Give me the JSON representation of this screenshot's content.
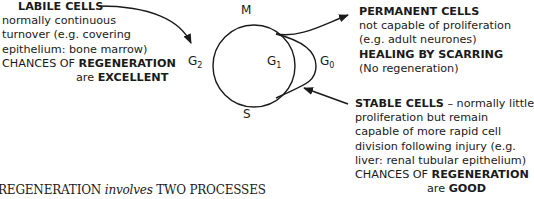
{
  "cycle": {
    "phase_m": "M",
    "phase_s": "S",
    "phase_g1": "G",
    "phase_g1_sub": "1",
    "phase_g2": "G",
    "phase_g2_sub": "2",
    "phase_g0": "G",
    "phase_g0_sub": "0"
  },
  "labile": {
    "title": "LABILE CELLS",
    "line1": "normally continuous",
    "line2": "turnover (e.g. covering",
    "line3": "epithelium: bone marrow)",
    "line4_pre": "CHANCES OF ",
    "line4_bold": "REGENERATION",
    "line5_pre": "are ",
    "line5_bold": "EXCELLENT"
  },
  "permanent": {
    "title": "PERMANENT CELLS",
    "line1": "not capable of proliferation",
    "line2": "(e.g. adult neurones)",
    "line3_bold": "HEALING BY SCARRING",
    "line4": "(No regeneration)"
  },
  "stable": {
    "title": "STABLE CELLS",
    "title_rest": " – normally little",
    "line1": "proliferation but remain",
    "line2": "capable of more rapid cell",
    "line3": "division following injury (e.g.",
    "line4": "liver: renal tubular epithelium)",
    "line5_pre": "CHANCES OF ",
    "line5_bold": "REGENERATION",
    "line6_pre": "are ",
    "line6_bold": "GOOD"
  },
  "footer": {
    "pre": "REGENERATION ",
    "italic": "involves",
    "post": " TWO PROCESSES"
  }
}
